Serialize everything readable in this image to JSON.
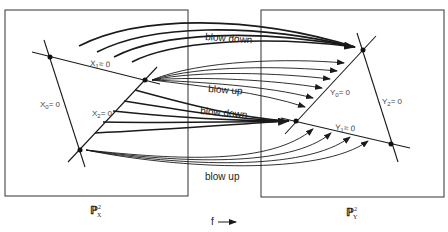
{
  "diagram": {
    "type": "cremona-transformation",
    "source_plane": {
      "label": "ℙ",
      "superscript": "2",
      "subscript": "X",
      "lines": [
        {
          "id": "X0",
          "label": "X",
          "sub": "0",
          "eq": "= 0"
        },
        {
          "id": "X1",
          "label": "X",
          "sub": "1",
          "eq": "= 0"
        },
        {
          "id": "X2",
          "label": "X",
          "sub": "2",
          "eq": "= 0"
        }
      ]
    },
    "target_plane": {
      "label": "ℙ",
      "superscript": "2",
      "subscript": "Y",
      "lines": [
        {
          "id": "Y0",
          "label": "Y",
          "sub": "0",
          "eq": "= 0"
        },
        {
          "id": "Y1",
          "label": "Y",
          "sub": "1",
          "eq": "= 0"
        },
        {
          "id": "Y2",
          "label": "Y",
          "sub": "2",
          "eq": "= 0"
        }
      ]
    },
    "annotations": {
      "blow_down_1": "blow down",
      "blow_up_1": "blow up",
      "blow_down_2": "blow down",
      "blow_up_2": "blow up"
    },
    "map": {
      "label": "f",
      "direction": "right-arrow"
    },
    "colors": {
      "stroke": "#1a1a1a",
      "text": "#444444",
      "background": "#ffffff"
    }
  }
}
